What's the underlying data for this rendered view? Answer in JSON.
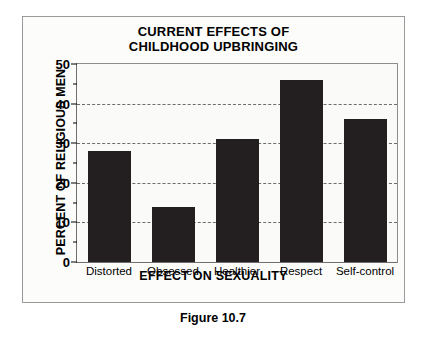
{
  "caption": "Figure 10.7",
  "chart_data": {
    "type": "bar",
    "title": "CURRENT EFFECTS OF CHILDHOOD UPBRINGING",
    "title_lines": [
      "CURRENT EFFECTS OF",
      "CHILDHOOD UPBRINGING"
    ],
    "xlabel": "EFFECT ON SEXUALITY",
    "ylabel": "PERCENT OF RELIGIOUS MEN",
    "categories": [
      "Distorted",
      "Obsessed",
      "Healthier",
      "Respect",
      "Self-control"
    ],
    "values": [
      28,
      13.8,
      31,
      46,
      36
    ],
    "ylim": [
      0,
      50
    ],
    "ytick_labels": [
      "0",
      "10",
      "20",
      "30",
      "40",
      "50"
    ],
    "ytick_values": [
      0,
      10,
      20,
      30,
      40,
      50
    ],
    "yminor_values": [
      5,
      15,
      25,
      35,
      45
    ],
    "gridline_values": [
      10,
      20,
      30,
      40
    ],
    "grid": true,
    "legend": "none",
    "bar_color": "#231f20",
    "plot_background": "#fafaf8",
    "frame_color": "#9a9a9a"
  }
}
